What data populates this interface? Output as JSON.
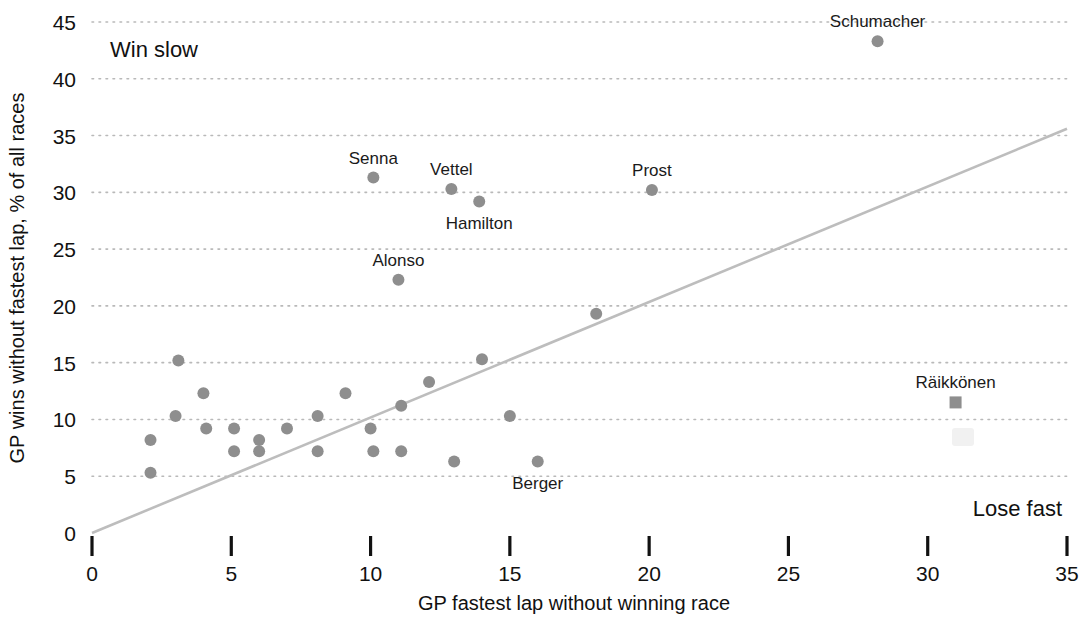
{
  "chart_data": {
    "type": "scatter",
    "title": "",
    "xlabel": "GP fastest lap without winning race",
    "ylabel": "GP wins without fastest lap, % of all races",
    "xlim": [
      0,
      35
    ],
    "ylim": [
      0,
      45
    ],
    "xticks": [
      0,
      5,
      10,
      15,
      20,
      25,
      30,
      35
    ],
    "yticks": [
      0,
      5,
      10,
      15,
      20,
      25,
      30,
      35,
      40,
      45
    ],
    "grid": "horizontal-dotted",
    "legend": "none",
    "annotations": [
      {
        "text": "Win slow",
        "x": 1.0,
        "y": 42.5,
        "anchor": "left"
      },
      {
        "text": "Lose fast",
        "x": 34.4,
        "y": 2.6,
        "anchor": "right"
      }
    ],
    "reference_line": {
      "label": "parity line",
      "from": {
        "x": 0,
        "y": 0
      },
      "to": {
        "x": 35,
        "y": 35.6
      }
    },
    "points": [
      {
        "name": "Schumacher",
        "x": 28.2,
        "y": 43.3,
        "marker": "circle",
        "label": "Schumacher",
        "label_pos": "above"
      },
      {
        "name": "Senna",
        "x": 10.1,
        "y": 31.3,
        "marker": "circle",
        "label": "Senna",
        "label_pos": "above"
      },
      {
        "name": "Vettel",
        "x": 12.9,
        "y": 30.3,
        "marker": "circle",
        "label": "Vettel",
        "label_pos": "above"
      },
      {
        "name": "Prost",
        "x": 20.1,
        "y": 30.2,
        "marker": "circle",
        "label": "Prost",
        "label_pos": "above"
      },
      {
        "name": "Hamilton",
        "x": 13.9,
        "y": 29.2,
        "marker": "circle",
        "label": "Hamilton",
        "label_pos": "below"
      },
      {
        "name": "Alonso",
        "x": 11.0,
        "y": 22.3,
        "marker": "circle",
        "label": "Alonso",
        "label_pos": "above"
      },
      {
        "name": "unnamed-18-19",
        "x": 18.1,
        "y": 19.3,
        "marker": "circle",
        "label": "",
        "label_pos": ""
      },
      {
        "name": "unnamed-3-15",
        "x": 3.1,
        "y": 15.2,
        "marker": "circle",
        "label": "",
        "label_pos": ""
      },
      {
        "name": "unnamed-14-15",
        "x": 14.0,
        "y": 15.3,
        "marker": "circle",
        "label": "",
        "label_pos": ""
      },
      {
        "name": "unnamed-12-13",
        "x": 12.1,
        "y": 13.3,
        "marker": "circle",
        "label": "",
        "label_pos": ""
      },
      {
        "name": "unnamed-4-12",
        "x": 4.0,
        "y": 12.3,
        "marker": "circle",
        "label": "",
        "label_pos": ""
      },
      {
        "name": "unnamed-9-12",
        "x": 9.1,
        "y": 12.3,
        "marker": "circle",
        "label": "",
        "label_pos": ""
      },
      {
        "name": "Raikkonen",
        "x": 31.0,
        "y": 11.5,
        "marker": "square",
        "label": "Räikkönen",
        "label_pos": "above"
      },
      {
        "name": "unnamed-11-11",
        "x": 11.1,
        "y": 11.2,
        "marker": "circle",
        "label": "",
        "label_pos": ""
      },
      {
        "name": "unnamed-3-10",
        "x": 3.0,
        "y": 10.3,
        "marker": "circle",
        "label": "",
        "label_pos": ""
      },
      {
        "name": "unnamed-8-10",
        "x": 8.1,
        "y": 10.3,
        "marker": "circle",
        "label": "",
        "label_pos": ""
      },
      {
        "name": "unnamed-15-10",
        "x": 15.0,
        "y": 10.3,
        "marker": "circle",
        "label": "",
        "label_pos": ""
      },
      {
        "name": "unnamed-4-9",
        "x": 4.1,
        "y": 9.2,
        "marker": "circle",
        "label": "",
        "label_pos": ""
      },
      {
        "name": "unnamed-5-9",
        "x": 5.1,
        "y": 9.2,
        "marker": "circle",
        "label": "",
        "label_pos": ""
      },
      {
        "name": "unnamed-7-9",
        "x": 7.0,
        "y": 9.2,
        "marker": "circle",
        "label": "",
        "label_pos": ""
      },
      {
        "name": "unnamed-10-9",
        "x": 10.0,
        "y": 9.2,
        "marker": "circle",
        "label": "",
        "label_pos": ""
      },
      {
        "name": "unnamed-2-8",
        "x": 2.1,
        "y": 8.2,
        "marker": "circle",
        "label": "",
        "label_pos": ""
      },
      {
        "name": "unnamed-6-8",
        "x": 6.0,
        "y": 8.2,
        "marker": "circle",
        "label": "",
        "label_pos": ""
      },
      {
        "name": "unnamed-5-7",
        "x": 5.1,
        "y": 7.2,
        "marker": "circle",
        "label": "",
        "label_pos": ""
      },
      {
        "name": "unnamed-6-7",
        "x": 6.0,
        "y": 7.2,
        "marker": "circle",
        "label": "",
        "label_pos": ""
      },
      {
        "name": "unnamed-8-7",
        "x": 8.1,
        "y": 7.2,
        "marker": "circle",
        "label": "",
        "label_pos": ""
      },
      {
        "name": "unnamed-10-7",
        "x": 10.1,
        "y": 7.2,
        "marker": "circle",
        "label": "",
        "label_pos": ""
      },
      {
        "name": "unnamed-11-7",
        "x": 11.1,
        "y": 7.2,
        "marker": "circle",
        "label": "",
        "label_pos": ""
      },
      {
        "name": "unnamed-13-6",
        "x": 13.0,
        "y": 6.3,
        "marker": "circle",
        "label": "",
        "label_pos": ""
      },
      {
        "name": "Berger",
        "x": 16.0,
        "y": 6.3,
        "marker": "circle",
        "label": "Berger",
        "label_pos": "below"
      },
      {
        "name": "unnamed-2-5",
        "x": 2.1,
        "y": 5.3,
        "marker": "circle",
        "label": "",
        "label_pos": ""
      }
    ]
  },
  "axis": {
    "x_title": "GP fastest lap without winning race",
    "y_title": "GP wins without fastest lap, % of all races",
    "x_tick_labels": [
      "0",
      "5",
      "10",
      "15",
      "20",
      "25",
      "30",
      "35"
    ],
    "y_tick_labels": [
      "0",
      "5",
      "10",
      "15",
      "20",
      "25",
      "30",
      "35",
      "40",
      "45"
    ]
  },
  "notes": {
    "top_left": "Win slow",
    "bottom_right": "Lose fast"
  },
  "colors": {
    "marker": "#8e8e8e",
    "gridline": "#b9b9b9",
    "trendline": "#bdbdbd",
    "axis": "#111111",
    "text": "#1a1a1a",
    "background": "#ffffff"
  }
}
